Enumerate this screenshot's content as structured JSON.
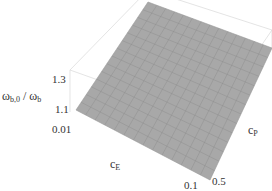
{
  "chart_data": {
    "type": "surface3d",
    "title": "",
    "xlabel": "c_E",
    "ylabel": "c_P",
    "zlabel": "ω_b,0 / ω_b",
    "xlabel_main": "c",
    "xlabel_sub": "E",
    "ylabel_main": "c",
    "ylabel_sub": "P",
    "zlabel_main": "ω",
    "zlabel_sub1": "b,0",
    "zlabel_sep": " / ω",
    "zlabel_sub2": "b",
    "x_ticks": [
      "0.01",
      "0.1"
    ],
    "y_ticks": [
      "0.5"
    ],
    "z_ticks": [
      "1.3",
      "1.1"
    ],
    "xlim": [
      0.01,
      0.1
    ],
    "ylim": [
      0,
      0.5
    ],
    "zlim": [
      1.0,
      1.4
    ],
    "grid_lines": 14,
    "surface_color": "#a8a8a8",
    "mesh_color": "#8a8a8a",
    "box_color": "#d8d8d8"
  }
}
